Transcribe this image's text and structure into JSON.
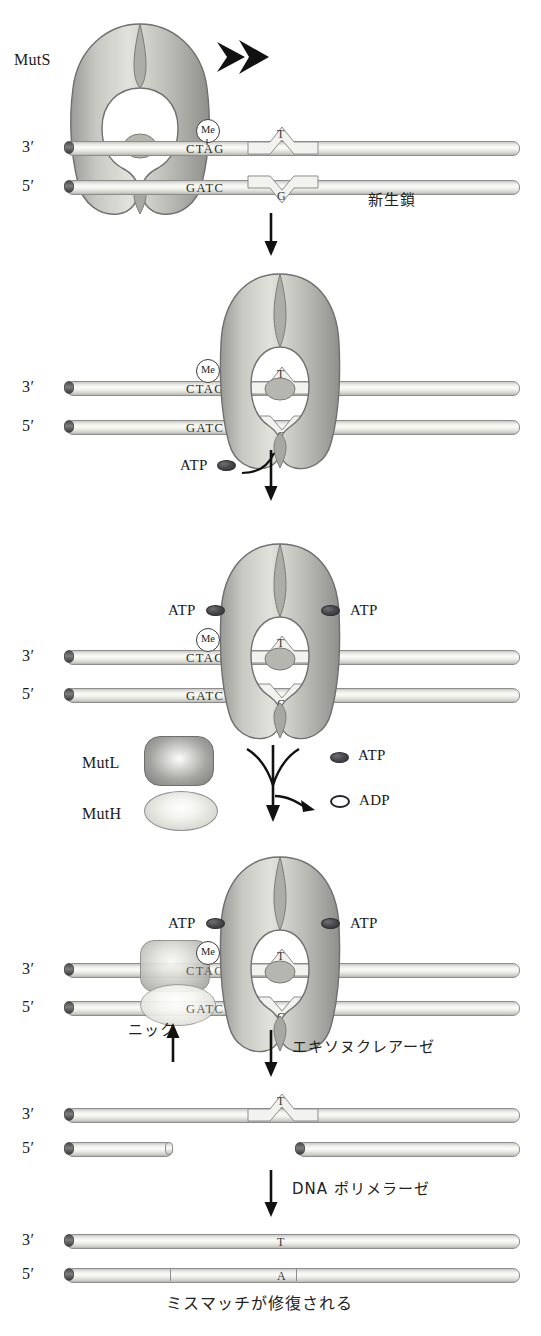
{
  "diagram": {
    "colors": {
      "protein_fill": "#b9b9b4",
      "protein_edge": "#6f6f6f",
      "dna_fill": "#f2f2ee",
      "dna_edge": "#8d8d8d",
      "atp_fill": "#3a3a40",
      "text": "#1a1a1a"
    }
  },
  "labels": {
    "muts": "MutS",
    "mutl": "MutL",
    "muth": "MutH",
    "atp": "ATP",
    "adp": "ADP",
    "me": "Me",
    "three_prime": "3′",
    "five_prime": "5′",
    "nascent_strand": "新生鎖",
    "nick": "ニック",
    "exonuclease": "エキソヌクレアーゼ",
    "dna_polymerase": "DNA ポリメラーゼ",
    "caption": "ミスマッチが修復される"
  },
  "sequences": {
    "top_strand": "CTAG",
    "bottom_strand": "GATC",
    "mismatch_top": "T",
    "mismatch_bottom": "G",
    "repaired_top": "T",
    "repaired_bottom": "A"
  },
  "panels": [
    {
      "id": "panel-1",
      "step": 1,
      "description": "MutS scans DNA and slides toward the T/G mismatch",
      "muts_present": true,
      "muts_position": "left-of-mismatch",
      "scan_arrow": true,
      "atp_bound": 0,
      "mutl_present": false,
      "muth_present": false,
      "labels_shown": [
        "MutS",
        "Me",
        "CTAG",
        "GATC",
        "T",
        "G",
        "3′",
        "5′",
        "新生鎖"
      ]
    },
    {
      "id": "panel-2",
      "step": 2,
      "description": "MutS binds and clamps at the mismatch; ATP arrives",
      "muts_present": true,
      "muts_position": "at-mismatch",
      "scan_arrow": false,
      "atp_bound": 0,
      "atp_incoming": true,
      "mutl_present": false,
      "muth_present": false,
      "labels_shown": [
        "Me",
        "CTAG",
        "GATC",
        "T",
        "G",
        "3′",
        "5′",
        "ATP"
      ]
    },
    {
      "id": "panel-3",
      "step": 3,
      "description": "Two ATP bind MutS, converting it to a sliding clamp",
      "muts_present": true,
      "muts_position": "at-mismatch",
      "atp_bound": 2,
      "mutl_present": false,
      "muth_present": false,
      "legend": true,
      "labels_shown": [
        "ATP",
        "ATP",
        "Me",
        "CTAG",
        "GATC",
        "T",
        "G",
        "3′",
        "5′",
        "MutL",
        "MutH",
        "ADP"
      ]
    },
    {
      "id": "panel-4",
      "step": 4,
      "description": "MutL and MutH assemble at the hemimethylated GATC site and nick the new strand",
      "muts_present": true,
      "atp_bound": 2,
      "mutl_present": true,
      "muth_present": true,
      "nick_marked": true,
      "labels_shown": [
        "ATP",
        "ATP",
        "Me",
        "CTAG",
        "GATC",
        "T",
        "G",
        "3′",
        "5′",
        "ニック"
      ]
    },
    {
      "id": "panel-5",
      "step": 5,
      "description": "Exonuclease removes the nicked nascent strand segment, leaving a gap",
      "muts_present": false,
      "gap_in_bottom_strand": true,
      "mismatch_visible": true,
      "labels_shown": [
        "3′",
        "5′",
        "T"
      ]
    },
    {
      "id": "panel-6",
      "step": 6,
      "description": "DNA polymerase resynthesizes the strand, restoring the correct T·A pair",
      "muts_present": false,
      "gap_in_bottom_strand": false,
      "repaired": true,
      "labels_shown": [
        "3′",
        "5′",
        "T",
        "A"
      ]
    }
  ],
  "step_arrows": [
    {
      "from": "panel-1",
      "to": "panel-2",
      "label": ""
    },
    {
      "from": "panel-2",
      "to": "panel-3",
      "label": "ATP"
    },
    {
      "from": "panel-3",
      "to": "panel-4",
      "label": "ADP"
    },
    {
      "from": "panel-4",
      "to": "panel-5",
      "label": "エキソヌクレアーゼ"
    },
    {
      "from": "panel-5",
      "to": "panel-6",
      "label": "DNA ポリメラーゼ"
    }
  ]
}
